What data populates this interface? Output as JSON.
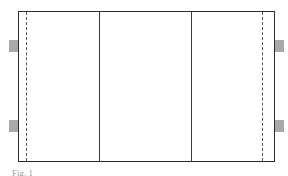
{
  "figure": {
    "type": "schematic-layout",
    "outer_rect": {
      "x": 18,
      "y": 11,
      "width": 257,
      "height": 151
    },
    "divider_lines": [
      {
        "name": "left-divider",
        "x": 99
      },
      {
        "name": "right-divider",
        "x": 191
      }
    ],
    "dashed_lines": [
      {
        "name": "left-dashed",
        "x": 26
      },
      {
        "name": "right-dashed",
        "x": 263
      }
    ],
    "tabs": [
      {
        "name": "left-top-tab",
        "side": "left",
        "y": 40
      },
      {
        "name": "left-bottom-tab",
        "side": "left",
        "y": 120
      },
      {
        "name": "right-top-tab",
        "side": "right",
        "y": 40
      },
      {
        "name": "right-bottom-tab",
        "side": "right",
        "y": 120
      }
    ],
    "colors": {
      "stroke": "#2b2b2b",
      "dashed": "#555555",
      "tab": "#a9a9a9",
      "background": "#ffffff"
    },
    "caption": "Fig. 1"
  }
}
